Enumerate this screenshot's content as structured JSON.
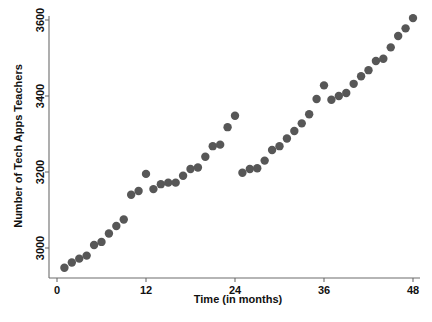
{
  "chart_data": {
    "type": "scatter",
    "title": "",
    "xlabel": "Time (in months)",
    "ylabel": "Number of Tech Apps Teachers",
    "xlim": [
      0,
      49.5
    ],
    "ylim": [
      2930,
      3650
    ],
    "xticks": [
      0,
      12,
      24,
      36,
      48
    ],
    "xtick_labels": [
      "0",
      "12",
      "24",
      "36",
      "48"
    ],
    "yticks": [
      3000,
      3200,
      3400,
      3600
    ],
    "ytick_labels": [
      "3000",
      "3200",
      "3400",
      "3600"
    ],
    "grid": false,
    "legend": null,
    "marker_color": "#575757",
    "marker_size": 4.2,
    "axis_color": "#6c6c6c",
    "background": "#ffffff",
    "series": [
      {
        "name": "Tech Apps Teachers",
        "x": [
          1,
          2,
          3,
          4,
          5,
          6,
          7,
          8,
          9,
          10,
          11,
          12,
          13,
          14,
          15,
          16,
          17,
          18,
          19,
          20,
          21,
          22,
          23,
          24,
          25,
          26,
          27,
          28,
          29,
          30,
          31,
          32,
          33,
          34,
          35,
          36,
          37,
          38,
          39,
          40,
          41,
          42,
          43,
          44,
          45,
          46,
          47,
          48
        ],
        "y": [
          2948,
          2962,
          2972,
          2980,
          3008,
          3016,
          3038,
          3058,
          3075,
          3140,
          3150,
          3195,
          3155,
          3168,
          3172,
          3172,
          3190,
          3208,
          3212,
          3240,
          3268,
          3272,
          3318,
          3348,
          3198,
          3208,
          3210,
          3230,
          3258,
          3268,
          3288,
          3308,
          3328,
          3352,
          3392,
          3428,
          3390,
          3400,
          3408,
          3432,
          3452,
          3468,
          3492,
          3498,
          3528,
          3558,
          3578,
          3605
        ]
      }
    ]
  }
}
